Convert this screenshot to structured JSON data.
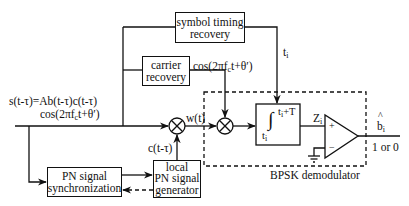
{
  "diagram": {
    "type": "block-diagram",
    "blocks": {
      "symbol_timing": {
        "line1": "symbol timing",
        "line2": "recovery"
      },
      "carrier": {
        "line1": "carrier",
        "line2": "recovery"
      },
      "pn_sync": {
        "line1": "PN signal",
        "line2": "synchronization"
      },
      "local_pn": {
        "line1": "local",
        "line2": "PN signal",
        "line3": "generator"
      },
      "integrator": {
        "upper_limit": "t",
        "upper_sub": "i",
        "upper_suffix": "+T",
        "lower_limit": "t",
        "lower_sub": "i"
      },
      "demodulator_label": "BPSK demodulator"
    },
    "signals": {
      "input_line1": "s(t-τ)=Ab(t-τ)c(t-τ)",
      "input_line2_prefix": "cos(2πf",
      "input_line2_sub": "c",
      "input_line2_suffix": "t+θ′)",
      "carrier_out_prefix": "cos(2πf",
      "carrier_out_sub": "c",
      "carrier_out_suffix": "t+θ′)",
      "timing": "t",
      "timing_sub": "i",
      "mixer_out": "w(t)",
      "pn_code": "c(t-τ)",
      "integrator_out": "Z",
      "integrator_out_sub": "i",
      "comparator_plus": "+",
      "comparator_minus": "−",
      "decision_hat": "^",
      "decision": "b",
      "decision_sub": "i",
      "decision_values": "1 or 0"
    }
  }
}
